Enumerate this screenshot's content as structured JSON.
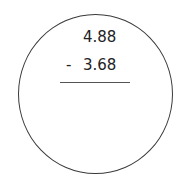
{
  "problem": {
    "operation": "subtraction",
    "top_number": "4.88",
    "operator": "-",
    "bottom_number": "3.68",
    "answer": ""
  }
}
